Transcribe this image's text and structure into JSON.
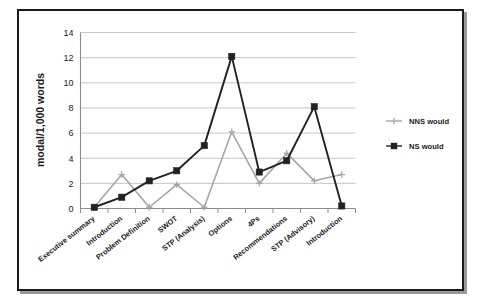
{
  "chart_data": {
    "type": "line",
    "title": "",
    "xlabel": "",
    "ylabel": "modal/1,000 words",
    "ylim": [
      0,
      14
    ],
    "yticks": [
      0,
      2,
      4,
      6,
      8,
      10,
      12,
      14
    ],
    "grid": true,
    "legend_position": "right",
    "categories": [
      "Executive summary",
      "Introduction",
      "Problem Definition",
      "SWOT",
      "STP (Analysis)",
      "Options",
      "4Ps",
      "Recommendations",
      "STP (Advisory)",
      "Introduction"
    ],
    "series": [
      {
        "name": "NNS would",
        "color": "#a6a6a6",
        "marker": "cross",
        "values": [
          0.1,
          2.7,
          0.1,
          1.9,
          0.1,
          6.1,
          2.0,
          4.4,
          2.2,
          2.7
        ]
      },
      {
        "name": "NS would",
        "color": "#222222",
        "marker": "square",
        "values": [
          0.1,
          0.9,
          2.2,
          3.0,
          5.0,
          12.1,
          2.9,
          3.8,
          8.1,
          0.2
        ]
      }
    ]
  },
  "legend": {
    "entries": [
      {
        "label": "NNS would"
      },
      {
        "label": "NS would"
      }
    ]
  },
  "axes": {
    "y_tick_labels": [
      "0",
      "2",
      "4",
      "6",
      "8",
      "10",
      "12",
      "14"
    ],
    "y_axis_title": "modal/1,000 words"
  },
  "colors": {
    "frame": "#1b1b1b",
    "gridline": "#bfbfbf",
    "axis": "#8c8c8c",
    "series_nns": "#a6a6a6",
    "series_ns": "#222222",
    "background": "#ffffff"
  }
}
